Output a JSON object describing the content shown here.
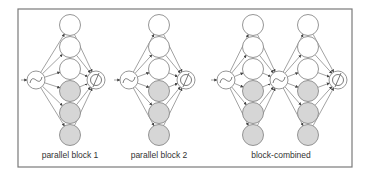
{
  "figure": {
    "labels": [
      "parallel block 1",
      "parallel block 2",
      "block-combined"
    ],
    "colors": {
      "frame": "#7a7a7a",
      "edge": "#8a8a8a",
      "node_white": "#ffffff",
      "node_gray": "#d6d6d6",
      "text": "#333333"
    }
  },
  "blocks": [
    {
      "name": "parallel block 1",
      "input_node": {
        "icon": "sine-wave-icon",
        "x": 36,
        "y": 80
      },
      "hidden_columns": [
        {
          "x": 70
        }
      ],
      "output_node": {
        "icon": "null-set-icon",
        "x": 96,
        "y": 80
      },
      "label_x": 70
    },
    {
      "name": "parallel block 2",
      "input_node": {
        "icon": "sine-wave-icon",
        "x": 129,
        "y": 80
      },
      "hidden_columns": [
        {
          "x": 159
        }
      ],
      "output_node": {
        "icon": "null-set-icon",
        "x": 186,
        "y": 80
      },
      "label_x": 159
    },
    {
      "name": "block-combined",
      "input_node": {
        "icon": "sine-wave-icon",
        "x": 226,
        "y": 80
      },
      "middle_node": {
        "icon": "sine-wave-icon",
        "x": 279,
        "y": 80
      },
      "hidden_columns": [
        {
          "x": 253
        },
        {
          "x": 308
        }
      ],
      "output_node": {
        "icon": "null-set-icon",
        "x": 338,
        "y": 80
      },
      "label_x": 280
    }
  ],
  "hidden_rows": [
    {
      "y": 25,
      "fill": "white"
    },
    {
      "y": 47,
      "fill": "white"
    },
    {
      "y": 69,
      "fill": "white"
    },
    {
      "y": 91,
      "fill": "gray"
    },
    {
      "y": 113,
      "fill": "gray"
    },
    {
      "y": 135,
      "fill": "gray"
    }
  ]
}
